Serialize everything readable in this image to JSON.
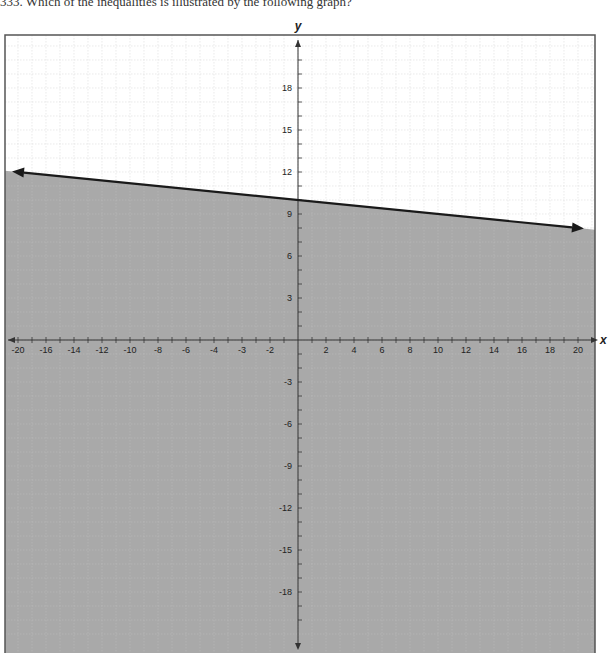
{
  "question": "333. Which of the inequalities is illustrated by the following graph?",
  "chart_data": {
    "type": "line",
    "title": "",
    "xlabel": "x",
    "ylabel": "y",
    "xlim": [
      -21,
      21
    ],
    "ylim": [
      -21,
      21
    ],
    "grid": true,
    "x_tick_labels": [
      {
        "value": -20,
        "label": "-20"
      },
      {
        "value": -18,
        "label": "-16"
      },
      {
        "value": -16,
        "label": "-14"
      },
      {
        "value": -14,
        "label": "-12"
      },
      {
        "value": -12,
        "label": "-10"
      },
      {
        "value": -10,
        "label": "-8"
      },
      {
        "value": -8,
        "label": "-6"
      },
      {
        "value": -6,
        "label": "-4"
      },
      {
        "value": -4,
        "label": "-3"
      },
      {
        "value": -2,
        "label": "-2"
      },
      {
        "value": 2,
        "label": "2"
      },
      {
        "value": 4,
        "label": "4"
      },
      {
        "value": 6,
        "label": "6"
      },
      {
        "value": 8,
        "label": "8"
      },
      {
        "value": 10,
        "label": "10"
      },
      {
        "value": 12,
        "label": "12"
      },
      {
        "value": 14,
        "label": "14"
      },
      {
        "value": 16,
        "label": "16"
      },
      {
        "value": 18,
        "label": "18"
      },
      {
        "value": 20,
        "label": "20"
      }
    ],
    "y_tick_labels": [
      {
        "value": 18,
        "label": "18"
      },
      {
        "value": 15,
        "label": "15"
      },
      {
        "value": 12,
        "label": "12"
      },
      {
        "value": 9,
        "label": "9"
      },
      {
        "value": 6,
        "label": "6"
      },
      {
        "value": 3,
        "label": "3"
      },
      {
        "value": -3,
        "label": "-3"
      },
      {
        "value": -6,
        "label": "-6"
      },
      {
        "value": -9,
        "label": "-9"
      },
      {
        "value": -12,
        "label": "-12"
      },
      {
        "value": -15,
        "label": "-15"
      },
      {
        "value": -18,
        "label": "-18"
      }
    ],
    "boundary_line": {
      "points": [
        [
          -20,
          12
        ],
        [
          20,
          8
        ]
      ],
      "equation": "y = -0.1x + 10",
      "style": "solid",
      "arrows": "both"
    },
    "shaded_region": "below",
    "inequality": "y <= -x/10 + 10",
    "colors": {
      "shade": "#a9a9a9",
      "line": "#1a1a1a",
      "grid": "#dcdcdc",
      "frame": "#555555"
    }
  }
}
